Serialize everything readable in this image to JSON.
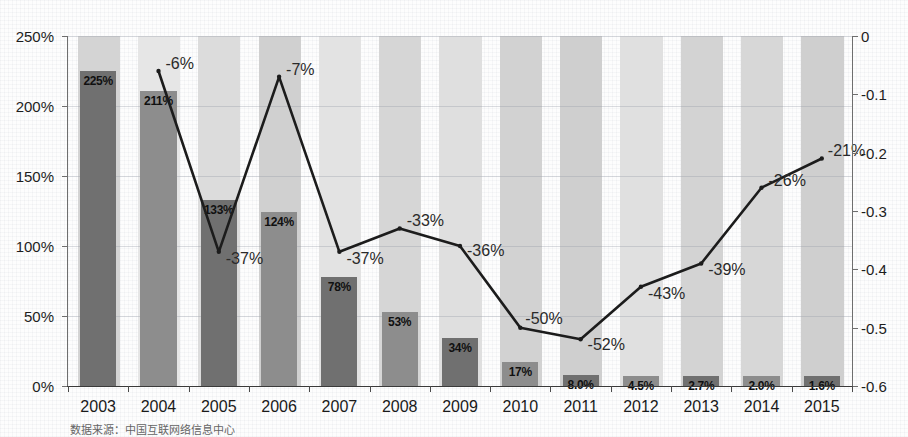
{
  "chart_data": {
    "type": "bar",
    "title": "",
    "subtitle": "",
    "xlabel": "",
    "ylabel": "",
    "grid": true,
    "legend_position": "none",
    "categories": [
      "2003",
      "2004",
      "2005",
      "2006",
      "2007",
      "2008",
      "2009",
      "2010",
      "2011",
      "2012",
      "2013",
      "2014",
      "2015"
    ],
    "left_axis": {
      "ticks": [
        "0%",
        "50%",
        "100%",
        "150%",
        "200%",
        "250%"
      ],
      "tick_values": [
        0,
        50,
        100,
        150,
        200,
        250
      ],
      "ylim": [
        0,
        250
      ]
    },
    "right_axis": {
      "ticks": [
        "0",
        "-0.1",
        "-0.2",
        "-0.3",
        "-0.4",
        "-0.5",
        "-0.6"
      ],
      "tick_values": [
        0,
        -0.1,
        -0.2,
        -0.3,
        -0.4,
        -0.5,
        -0.6
      ],
      "ylim": [
        -0.6,
        0
      ]
    },
    "series": [
      {
        "name": "bars",
        "type": "bar",
        "axis": "left",
        "values": [
          225,
          211,
          133,
          124,
          78,
          53,
          34,
          17,
          8.0,
          4.5,
          2.7,
          2.0,
          1.6
        ],
        "labels": [
          "225%",
          "211%",
          "133%",
          "124%",
          "78%",
          "53%",
          "34%",
          "17%",
          "8.0%",
          "4.5%",
          "2.7%",
          "2.0%",
          "1.6%"
        ]
      },
      {
        "name": "line",
        "type": "line",
        "axis": "right",
        "x": [
          "2004",
          "2005",
          "2006",
          "2007",
          "2008",
          "2009",
          "2010",
          "2011",
          "2012",
          "2013",
          "2014",
          "2015"
        ],
        "values": [
          -0.06,
          -0.37,
          -0.07,
          -0.37,
          -0.33,
          -0.36,
          -0.5,
          -0.52,
          -0.43,
          -0.39,
          -0.26,
          -0.21
        ],
        "labels": [
          "-6%",
          "-37%",
          "-7%",
          "-37%",
          "-33%",
          "-36%",
          "-50%",
          "-52%",
          "-43%",
          "-39%",
          "-26%",
          "-21%"
        ]
      }
    ],
    "colors": {
      "bar_dark": "#707070",
      "bar_mid": "#8d8d8d",
      "bar_light": "#a6a6a6",
      "band": "#d9d9d9",
      "line": "#1c1c1c",
      "axis": "#6e6e6e",
      "text": "#1a1a1a",
      "background": "#fdfdfd"
    }
  },
  "source_note": "数据来源：中国互联网络信息中心"
}
